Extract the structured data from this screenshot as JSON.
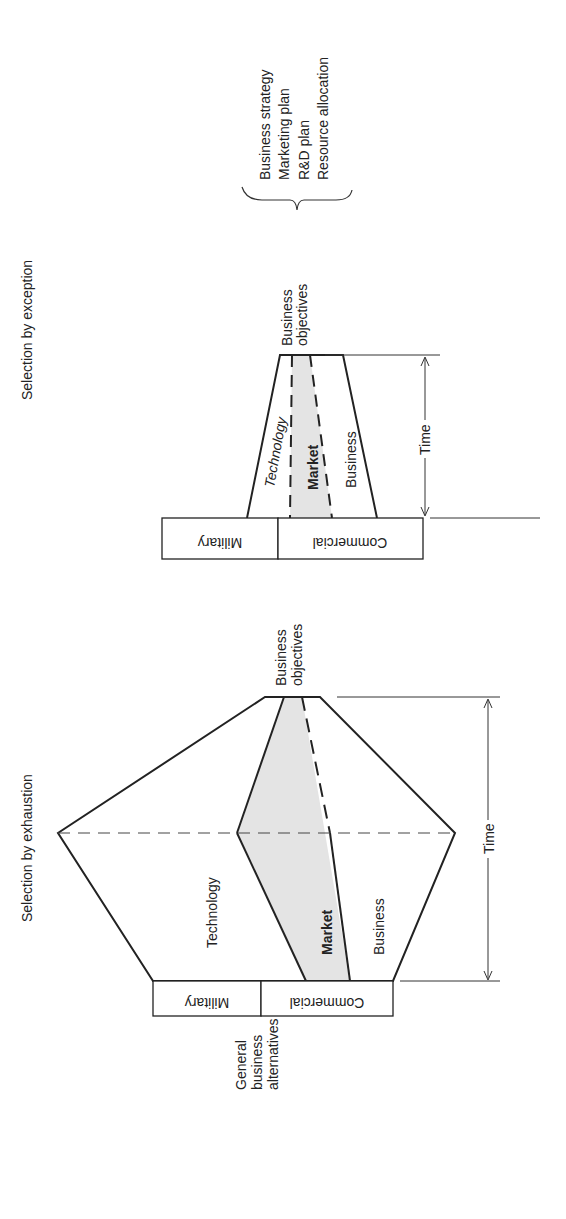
{
  "top_panel": {
    "title": "Selection by exception",
    "regions": [
      "Technology",
      "Market",
      "Business"
    ],
    "objectives_label": [
      "Business",
      "objectives"
    ],
    "base_boxes": [
      "Military",
      "Commercial"
    ],
    "time_label": "Time",
    "outputs": [
      "Business strategy",
      "Marketing plan",
      "R&D plan",
      "Resource allocation"
    ]
  },
  "bottom_panel": {
    "title": "Selection by exhaustion",
    "regions": [
      "Technology",
      "Market",
      "Business"
    ],
    "objectives_label": [
      "Business",
      "objectives"
    ],
    "base_boxes": [
      "Military",
      "Commercial"
    ],
    "base_label": [
      "General",
      "business",
      "alternatives"
    ],
    "time_label": "Time"
  },
  "colors": {
    "line": "#222222",
    "market_fill": "#e4e4e4"
  }
}
